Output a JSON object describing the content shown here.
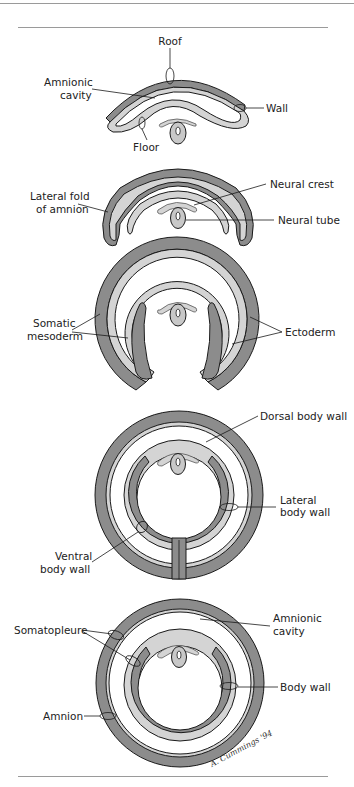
{
  "figure": {
    "type": "anatomical-diagram",
    "colors": {
      "somatic_mesoderm_dark": "#8c8c8c",
      "ectoderm_light": "#d4d4d4",
      "outline": "#1a1a1a",
      "background": "#ffffff",
      "rule": "#9a9a9a"
    },
    "stages": [
      {
        "id": "stage-1",
        "labels": {
          "roof": "Roof",
          "amnionic_cavity_1": "Amnionic",
          "amnionic_cavity_2": "cavity",
          "wall": "Wall",
          "floor": "Floor"
        }
      },
      {
        "id": "stage-2",
        "labels": {
          "lateral_fold_1": "Lateral fold",
          "lateral_fold_2": "of amnion",
          "neural_crest": "Neural crest",
          "neural_tube": "Neural tube"
        }
      },
      {
        "id": "stage-3",
        "labels": {
          "somatic_mesoderm_1": "Somatic",
          "somatic_mesoderm_2": "mesoderm",
          "ectoderm": "Ectoderm"
        }
      },
      {
        "id": "stage-4",
        "labels": {
          "dorsal_body_wall": "Dorsal body wall",
          "lateral_body_wall_1": "Lateral",
          "lateral_body_wall_2": "body wall",
          "ventral_body_wall_1": "Ventral",
          "ventral_body_wall_2": "body wall"
        }
      },
      {
        "id": "stage-5",
        "labels": {
          "somatopleure": "Somatopleure",
          "amnionic_cavity_1": "Amnionic",
          "amnionic_cavity_2": "cavity",
          "body_wall": "Body wall",
          "amnion": "Amnion"
        }
      }
    ],
    "signature": "A. Cummings '94"
  }
}
